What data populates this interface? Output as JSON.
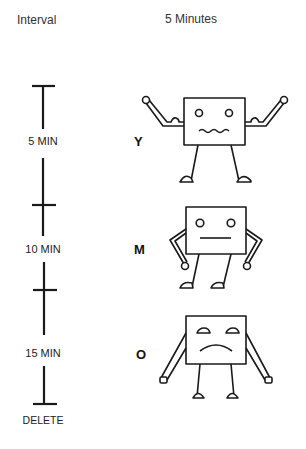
{
  "header": {
    "left_title": "Interval",
    "right_title": "5 Minutes"
  },
  "timeline": {
    "ticks": [
      {
        "label": "5 MIN"
      },
      {
        "label": "10 MIN"
      },
      {
        "label": "15 MIN"
      },
      {
        "label": "DELETE"
      }
    ]
  },
  "moods": [
    {
      "letter": "Y",
      "expression": "happy",
      "pose": "arms-raised"
    },
    {
      "letter": "M",
      "expression": "neutral",
      "pose": "arms-akimbo"
    },
    {
      "letter": "O",
      "expression": "sad",
      "pose": "arms-down"
    }
  ],
  "colors": {
    "line": "#1a1a1a",
    "background": "#ffffff"
  }
}
